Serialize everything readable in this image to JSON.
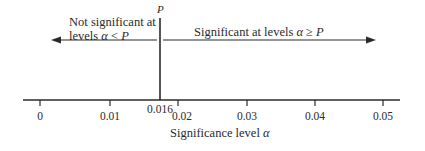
{
  "diagram": {
    "type": "number-line",
    "p_marker": {
      "label": "P",
      "value": 0.016,
      "value_label": "0.016"
    },
    "left_region": {
      "line1": "Not significant at",
      "line2_prefix": "levels ",
      "line2_alpha": "α",
      "line2_rel": " < ",
      "line2_p": "P"
    },
    "right_region": {
      "prefix": "Significant at levels ",
      "alpha": "α",
      "rel": " ≥ ",
      "p": "P"
    },
    "axis": {
      "title_prefix": "Significance level ",
      "title_alpha": "α",
      "ticks": [
        "0",
        "0.01",
        "0.02",
        "0.03",
        "0.04",
        "0.05"
      ],
      "range": [
        0,
        0.05
      ]
    },
    "colors": {
      "ink": "#2a2a2a",
      "background": "#ffffff"
    }
  }
}
